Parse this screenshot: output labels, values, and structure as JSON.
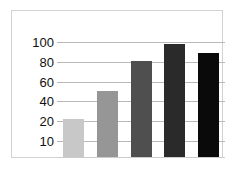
{
  "figure": {
    "background_color": "#ffffff",
    "frame_color": "#d2d2d2",
    "gridline_color": "#b9b9b9"
  },
  "chart_data": {
    "type": "bar",
    "title": "",
    "xlabel": "",
    "ylabel": "",
    "categories": [
      "1",
      "2",
      "3",
      "4",
      "5"
    ],
    "values": [
      22,
      50,
      81,
      98,
      89
    ],
    "ytick_labels": [
      "100",
      "80",
      "60",
      "40",
      "20",
      "10"
    ],
    "ytick_values": [
      100,
      80,
      60,
      40,
      20,
      10
    ],
    "ylim": [
      0,
      108
    ],
    "grid": true,
    "grid_axis": "y",
    "legend": false,
    "xtick_labels": [],
    "bar_colors": [
      "#c8c8c8",
      "#969696",
      "#4f4f4f",
      "#2a2a2a",
      "#0a0a0a"
    ]
  }
}
